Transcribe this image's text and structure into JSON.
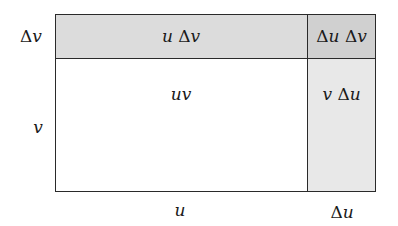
{
  "diagram": {
    "colors": {
      "top_band": "#dcdcdc",
      "corner": "#d0d0d0",
      "right_band": "#e8e8e8",
      "main": "#ffffff",
      "border": "#2a2a2a"
    },
    "cells": {
      "top_main": {
        "var1": "u",
        "delta": "Δ",
        "var2": "v"
      },
      "corner": {
        "delta1": "Δ",
        "var1": "u",
        "delta2": "Δ",
        "var2": "v"
      },
      "main": {
        "var1": "u",
        "var2": "v"
      },
      "right": {
        "var1": "v",
        "delta": "Δ",
        "var2": "u"
      }
    },
    "side_labels": {
      "left_top": {
        "delta": "Δ",
        "var": "v"
      },
      "left_main": {
        "var": "v"
      },
      "bottom_main": {
        "var": "u"
      },
      "bottom_right": {
        "delta": "Δ",
        "var": "u"
      }
    }
  }
}
